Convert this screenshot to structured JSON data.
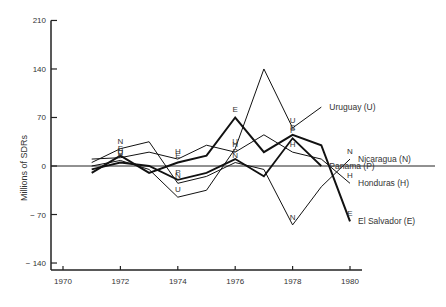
{
  "chart_data": {
    "type": "line",
    "title": "",
    "xlabel": "",
    "ylabel": "Millions of SDRs",
    "ylim": [
      -140,
      210
    ],
    "xlim": [
      1970,
      1980
    ],
    "yticks": [
      210,
      140,
      70,
      0,
      -70,
      -140
    ],
    "ytick_labels": [
      "210",
      "140",
      "70",
      "0",
      "− 70",
      "− 140"
    ],
    "xticks": [
      1970,
      1972,
      1974,
      1976,
      1978,
      1980
    ],
    "grid": false,
    "x": [
      1971,
      1972,
      1973,
      1974,
      1975,
      1976,
      1977,
      1978,
      1979,
      1980
    ],
    "series": [
      {
        "name": "Uruguay (U)",
        "marker": "U",
        "values": [
          0,
          8,
          -5,
          -45,
          -35,
          25,
          140,
          55,
          85,
          null
        ]
      },
      {
        "name": "Nicaragua (N)",
        "marker": "N",
        "values": [
          5,
          25,
          35,
          -25,
          -15,
          5,
          -5,
          -85,
          -30,
          10
        ]
      },
      {
        "name": "Panama (P)",
        "marker": "P",
        "values": [
          -5,
          5,
          0,
          -20,
          -10,
          10,
          -15,
          40,
          0,
          null
        ]
      },
      {
        "name": "Honduras (H)",
        "marker": "H",
        "values": [
          10,
          12,
          20,
          10,
          30,
          20,
          45,
          20,
          10,
          -25
        ]
      },
      {
        "name": "El Salvador (E)",
        "marker": "E",
        "values": [
          -10,
          15,
          -10,
          5,
          15,
          70,
          20,
          45,
          30,
          -80
        ]
      }
    ],
    "legend_position": "inline-right"
  }
}
